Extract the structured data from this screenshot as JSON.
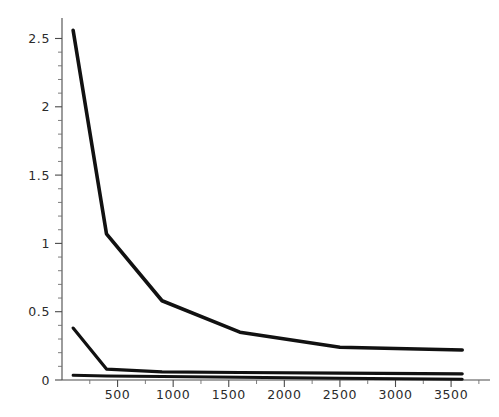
{
  "chart_data": {
    "type": "line",
    "title": "",
    "subtitle": "",
    "xlabel": "",
    "ylabel": "",
    "xlim": [
      0,
      3850
    ],
    "ylim": [
      0,
      2.65
    ],
    "grid": false,
    "legend": "none",
    "axis": {
      "y_ticks_major": [
        0,
        0.5,
        1,
        1.5,
        2,
        2.5
      ],
      "y_tick_labels": [
        "0",
        "0.5",
        "1",
        "1.5",
        "2",
        "2.5"
      ],
      "y_ticks_minor": [
        0.1,
        0.2,
        0.3,
        0.4,
        0.6,
        0.7,
        0.8,
        0.9,
        1.1,
        1.2,
        1.3,
        1.4,
        1.6,
        1.7,
        1.8,
        1.9,
        2.1,
        2.2,
        2.3,
        2.4,
        2.5
      ],
      "x_ticks_major": [
        500,
        1000,
        1500,
        2000,
        2500,
        3000,
        3500
      ],
      "x_tick_labels": [
        "500",
        "1000",
        "1500",
        "2000",
        "2500",
        "3000",
        "3500"
      ],
      "x_ticks_minor": [
        250,
        750,
        1250,
        1750,
        2250,
        2750,
        3250,
        3750
      ]
    },
    "x": [
      100,
      400,
      900,
      1600,
      2500,
      3600
    ],
    "series": [
      {
        "name": "series-1",
        "color": "#111111",
        "values": [
          2.56,
          1.07,
          0.58,
          0.35,
          0.24,
          0.22
        ]
      },
      {
        "name": "series-2",
        "color": "#111111",
        "values": [
          0.38,
          0.08,
          0.06,
          0.055,
          0.05,
          0.045
        ]
      },
      {
        "name": "series-3",
        "color": "#111111",
        "values": [
          0.035,
          0.03,
          0.025,
          0.02,
          0.013,
          0.005
        ]
      }
    ]
  }
}
